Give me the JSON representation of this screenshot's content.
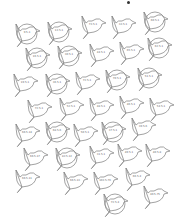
{
  "sheet": {
    "title": "",
    "stroke_color": "#8a8a8a",
    "circle_color": "#9a9a9a"
  },
  "birds": [
    {
      "x": 12,
      "y": 22,
      "label": "9.5-1",
      "circled": true,
      "flip": false
    },
    {
      "x": 44,
      "y": 20,
      "label": "13.5-1",
      "circled": true,
      "flip": false
    },
    {
      "x": 78,
      "y": 14,
      "label": "73.5-1",
      "circled": false,
      "flip": false
    },
    {
      "x": 108,
      "y": 14,
      "label": "33.5-1",
      "circled": false,
      "flip": false
    },
    {
      "x": 140,
      "y": 10,
      "label": "60.5-1",
      "circled": true,
      "flip": false
    },
    {
      "x": 22,
      "y": 46,
      "label": "16.5-1",
      "circled": true,
      "flip": false
    },
    {
      "x": 54,
      "y": 44,
      "label": "30.5-1",
      "circled": true,
      "flip": false
    },
    {
      "x": 86,
      "y": 42,
      "label": "44.5-1",
      "circled": false,
      "flip": false
    },
    {
      "x": 116,
      "y": 40,
      "label": "65.5-1",
      "circled": false,
      "flip": false
    },
    {
      "x": 144,
      "y": 36,
      "label": "62.5-1",
      "circled": true,
      "flip": false
    },
    {
      "x": 10,
      "y": 72,
      "label": "19.5-1",
      "circled": false,
      "flip": false
    },
    {
      "x": 42,
      "y": 72,
      "label": "36.5-1",
      "circled": true,
      "flip": false
    },
    {
      "x": 72,
      "y": 70,
      "label": "72.5-1",
      "circled": false,
      "flip": false
    },
    {
      "x": 102,
      "y": 68,
      "label": "70.5-1",
      "circled": true,
      "flip": false
    },
    {
      "x": 134,
      "y": 66,
      "label": "51.5-1",
      "circled": true,
      "flip": false
    },
    {
      "x": 24,
      "y": 98,
      "label": "72.5-1",
      "circled": false,
      "flip": false
    },
    {
      "x": 56,
      "y": 96,
      "label": "52.5-1",
      "circled": false,
      "flip": false
    },
    {
      "x": 86,
      "y": 96,
      "label": "48.5-1",
      "circled": false,
      "flip": false
    },
    {
      "x": 116,
      "y": 94,
      "label": "46.5-1",
      "circled": false,
      "flip": false
    },
    {
      "x": 146,
      "y": 96,
      "label": "54.5-1",
      "circled": false,
      "flip": false
    },
    {
      "x": 12,
      "y": 122,
      "label": "66.5-14",
      "circled": false,
      "flip": false
    },
    {
      "x": 42,
      "y": 120,
      "label": "68.5-6",
      "circled": true,
      "flip": false
    },
    {
      "x": 70,
      "y": 122,
      "label": "50.5-1",
      "circled": false,
      "flip": false
    },
    {
      "x": 98,
      "y": 120,
      "label": "37.5-1",
      "circled": true,
      "flip": false
    },
    {
      "x": 128,
      "y": 116,
      "label": "39.5-6",
      "circled": false,
      "flip": false
    },
    {
      "x": 20,
      "y": 146,
      "label": "66.5-17",
      "circled": false,
      "flip": false
    },
    {
      "x": 52,
      "y": 146,
      "label": "82.5-12",
      "circled": true,
      "flip": false
    },
    {
      "x": 86,
      "y": 144,
      "label": "31.5-1",
      "circled": false,
      "flip": false
    },
    {
      "x": 114,
      "y": 142,
      "label": "49.5-1",
      "circled": false,
      "flip": false
    },
    {
      "x": 142,
      "y": 142,
      "label": "40.5-8",
      "circled": false,
      "flip": false
    },
    {
      "x": 12,
      "y": 168,
      "label": "66.5-11",
      "circled": false,
      "flip": false
    },
    {
      "x": 60,
      "y": 170,
      "label": "66.5-13",
      "circled": false,
      "flip": false
    },
    {
      "x": 90,
      "y": 170,
      "label": "103.5-76",
      "circled": false,
      "flip": false
    },
    {
      "x": 122,
      "y": 166,
      "label": "66.5-4",
      "circled": false,
      "flip": false
    },
    {
      "x": 100,
      "y": 192,
      "label": "72.5-4",
      "circled": true,
      "flip": false
    },
    {
      "x": 140,
      "y": 184,
      "label": "40.5-75",
      "circled": false,
      "flip": false
    }
  ]
}
